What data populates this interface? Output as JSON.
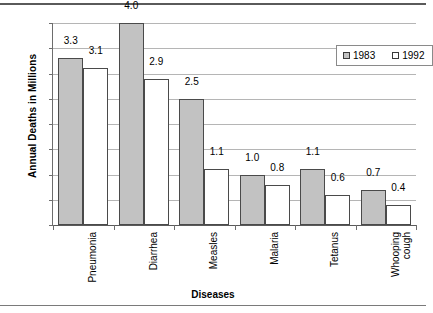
{
  "chart_data": {
    "type": "bar",
    "title": "",
    "xlabel": "Diseases",
    "ylabel": "Annual Deaths in Millions",
    "categories": [
      "Pneumonia",
      "Diarrhea",
      "Measles",
      "Malaria",
      "Tetanus",
      "Whooping cough"
    ],
    "series": [
      {
        "name": "1983",
        "values": [
          3.3,
          4.0,
          2.5,
          1.0,
          1.1,
          0.7
        ],
        "color": "#c2c2c2"
      },
      {
        "name": "1992",
        "values": [
          3.1,
          2.9,
          1.1,
          0.8,
          0.6,
          0.4
        ],
        "color": "#ffffff"
      }
    ],
    "data_labels": [
      [
        "3.3",
        "4.0",
        "2.5",
        "1.0",
        "1.1",
        "0.7"
      ],
      [
        "3.1",
        "2.9",
        "1.1",
        "0.8",
        "0.6",
        "0.4"
      ]
    ],
    "ylim": [
      0,
      4
    ],
    "ytick_labels": [
      "0",
      "0.5",
      "1",
      "1.5",
      "2",
      "2.5",
      "3",
      "3.5",
      "4"
    ],
    "ytick_values": [
      0,
      0.5,
      1,
      1.5,
      2,
      2.5,
      3,
      3.5,
      4
    ],
    "grid": true,
    "legend_position": "top-right-inside"
  },
  "legend": {
    "entries": [
      {
        "label": "1983",
        "swatch": "filled-gray-square"
      },
      {
        "label": "1992",
        "swatch": "empty-white-square"
      }
    ]
  }
}
